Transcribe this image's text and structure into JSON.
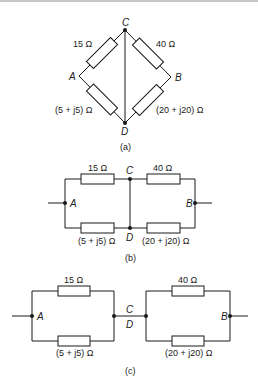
{
  "figure": {
    "a": {
      "caption": "(a)",
      "nodes": {
        "A": "A",
        "B": "B",
        "C": "C",
        "D": "D"
      },
      "resistors": {
        "AC": "15 Ω",
        "CB": "40 Ω",
        "AD": "(5 + j5) Ω",
        "DB": "(20 + j20) Ω"
      }
    },
    "b": {
      "caption": "(b)",
      "nodes": {
        "A": "A",
        "B": "B",
        "C": "C",
        "D": "D"
      },
      "resistors": {
        "AC": "15 Ω",
        "CB": "40 Ω",
        "AD": "(5 + j5) Ω",
        "DB": "(20 + j20) Ω"
      }
    },
    "c": {
      "caption": "(c)",
      "nodes": {
        "A": "A",
        "B": "B",
        "C": "C",
        "D": "D"
      },
      "resistors": {
        "AC": "15 Ω",
        "CB": "40 Ω",
        "AD": "(5 + j5) Ω",
        "DB": "(20 + j20) Ω"
      }
    }
  }
}
